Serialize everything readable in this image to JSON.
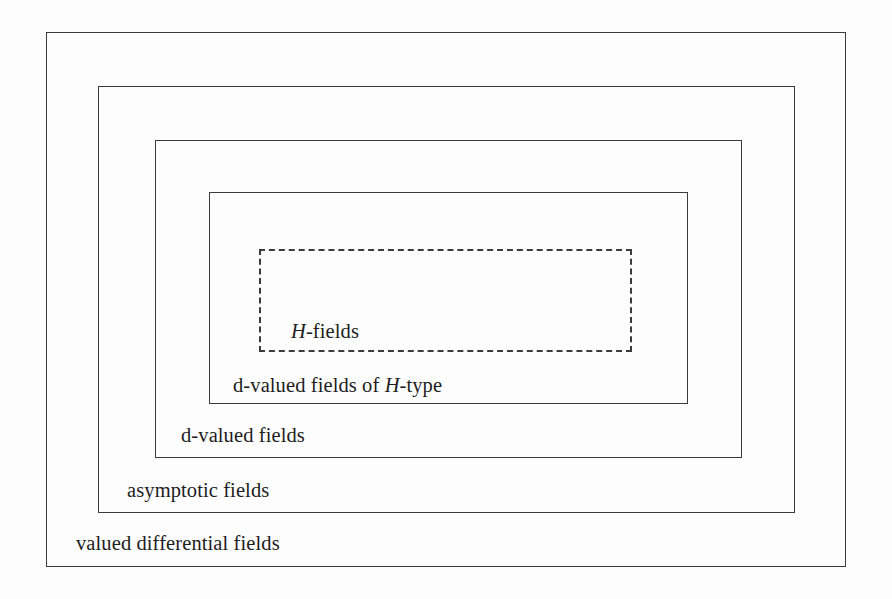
{
  "diagram": {
    "type": "nested-set-diagram",
    "background_color": "#fdfdfd",
    "line_color": "#3b3b3b",
    "text_color": "#1d1d1d",
    "levels": [
      {
        "id": "outer",
        "label_plain": "valued differential fields",
        "label_prefix": "valued differential fields",
        "label_italic": "",
        "label_suffix": "",
        "border_style": "solid",
        "rect": {
          "x": 46,
          "y": 32,
          "width": 800,
          "height": 535
        }
      },
      {
        "id": "asymptotic",
        "label_plain": "asymptotic fields",
        "label_prefix": "asymptotic fields",
        "label_italic": "",
        "label_suffix": "",
        "border_style": "solid",
        "rect": {
          "x": 98,
          "y": 86,
          "width": 697,
          "height": 427
        }
      },
      {
        "id": "d-valued",
        "label_plain": "d-valued fields",
        "label_prefix": "d-valued fields",
        "label_italic": "",
        "label_suffix": "",
        "border_style": "solid",
        "rect": {
          "x": 155,
          "y": 140,
          "width": 587,
          "height": 318
        }
      },
      {
        "id": "d-valued-h-type",
        "label_plain": "d-valued fields of H-type",
        "label_prefix": "d-valued fields of ",
        "label_italic": "H",
        "label_suffix": "-type",
        "border_style": "solid",
        "rect": {
          "x": 209,
          "y": 192,
          "width": 479,
          "height": 212
        }
      },
      {
        "id": "h-fields",
        "label_plain": "H-fields",
        "label_prefix": "",
        "label_italic": "H",
        "label_suffix": "-fields",
        "border_style": "dashed",
        "rect": {
          "x": 259,
          "y": 249,
          "width": 373,
          "height": 103
        }
      }
    ]
  }
}
